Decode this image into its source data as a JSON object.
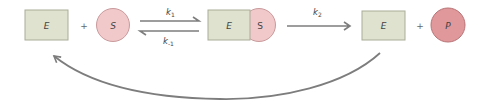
{
  "diagram": {
    "nodes": {
      "enzyme1": "E",
      "substrate": "S",
      "complex_enzyme": "E",
      "complex_substrate": "S",
      "enzyme2": "E",
      "product": "P"
    },
    "operators": {
      "plus1": "+",
      "plus2": "+"
    },
    "rates": {
      "k1": {
        "base": "k",
        "sub": "1"
      },
      "k_minus1": {
        "base": "k",
        "sub": "-1"
      },
      "k2": {
        "base": "k",
        "sub": "2"
      }
    },
    "colors": {
      "enzyme_fill": "#dfe2cf",
      "enzyme_stroke": "#a9ad98",
      "substrate_fill": "#f1c9ca",
      "substrate_stroke": "#c99a9c",
      "product_fill": "#e0989b",
      "product_stroke": "#b87477",
      "arrow": "#7d7d7d"
    }
  }
}
